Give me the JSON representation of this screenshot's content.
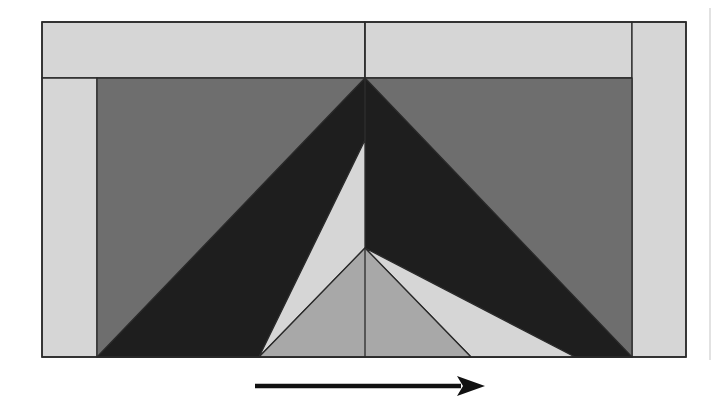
{
  "diagram": {
    "title": "Geometric quilt-block style composition with direction arrow",
    "canvas": {
      "width": 718,
      "height": 411,
      "background": "#ffffff"
    },
    "colors": {
      "light": "#d6d6d6",
      "medium": "#a8a8a8",
      "dark_gray": "#6e6e6e",
      "black": "#1e1e1e",
      "stroke": "#2a2a2a",
      "arrow": "#111111",
      "edge_line": "#e2e2e2"
    },
    "frame": {
      "x": 42,
      "y": 22,
      "width": 644,
      "height": 335
    },
    "regions": [
      {
        "name": "top-band-left",
        "fill": "light",
        "points": [
          [
            42,
            22
          ],
          [
            365,
            22
          ],
          [
            365,
            78
          ],
          [
            42,
            78
          ]
        ]
      },
      {
        "name": "top-band-right",
        "fill": "light",
        "points": [
          [
            365,
            22
          ],
          [
            632,
            22
          ],
          [
            632,
            78
          ],
          [
            365,
            78
          ]
        ]
      },
      {
        "name": "left-strip",
        "fill": "light",
        "points": [
          [
            42,
            78
          ],
          [
            97,
            78
          ],
          [
            97,
            357
          ],
          [
            42,
            357
          ]
        ]
      },
      {
        "name": "right-strip",
        "fill": "light",
        "points": [
          [
            632,
            22
          ],
          [
            686,
            22
          ],
          [
            686,
            357
          ],
          [
            632,
            357
          ]
        ]
      },
      {
        "name": "inner-background",
        "fill": "dark_gray",
        "points": [
          [
            97,
            78
          ],
          [
            632,
            78
          ],
          [
            632,
            357
          ],
          [
            97,
            357
          ]
        ]
      },
      {
        "name": "left-black-wedge",
        "fill": "black",
        "points": [
          [
            365,
            78
          ],
          [
            97,
            357
          ],
          [
            259,
            357
          ],
          [
            365,
            140
          ]
        ]
      },
      {
        "name": "right-black-wedge",
        "fill": "black",
        "points": [
          [
            365,
            78
          ],
          [
            632,
            357
          ],
          [
            575,
            357
          ],
          [
            365,
            248
          ]
        ]
      },
      {
        "name": "left-light-sliver",
        "fill": "light",
        "points": [
          [
            365,
            140
          ],
          [
            259,
            357
          ],
          [
            365,
            248
          ]
        ]
      },
      {
        "name": "right-light-wedge",
        "fill": "light",
        "points": [
          [
            365,
            248
          ],
          [
            575,
            357
          ],
          [
            471,
            357
          ]
        ]
      },
      {
        "name": "center-medium-triangle",
        "fill": "medium",
        "points": [
          [
            365,
            248
          ],
          [
            259,
            357
          ],
          [
            471,
            357
          ]
        ]
      }
    ],
    "lines": [
      {
        "name": "center-divider-top",
        "from": [
          365,
          22
        ],
        "to": [
          365,
          140
        ]
      },
      {
        "name": "center-divider-bottom",
        "from": [
          365,
          248
        ],
        "to": [
          365,
          357
        ]
      }
    ],
    "arrow": {
      "x1": 255,
      "y1": 386,
      "x2": 485,
      "y2": 386,
      "direction": "right",
      "head_length": 28,
      "head_half_width": 10
    },
    "edge_line": {
      "x": 710,
      "y1": 8,
      "y2": 360
    }
  }
}
